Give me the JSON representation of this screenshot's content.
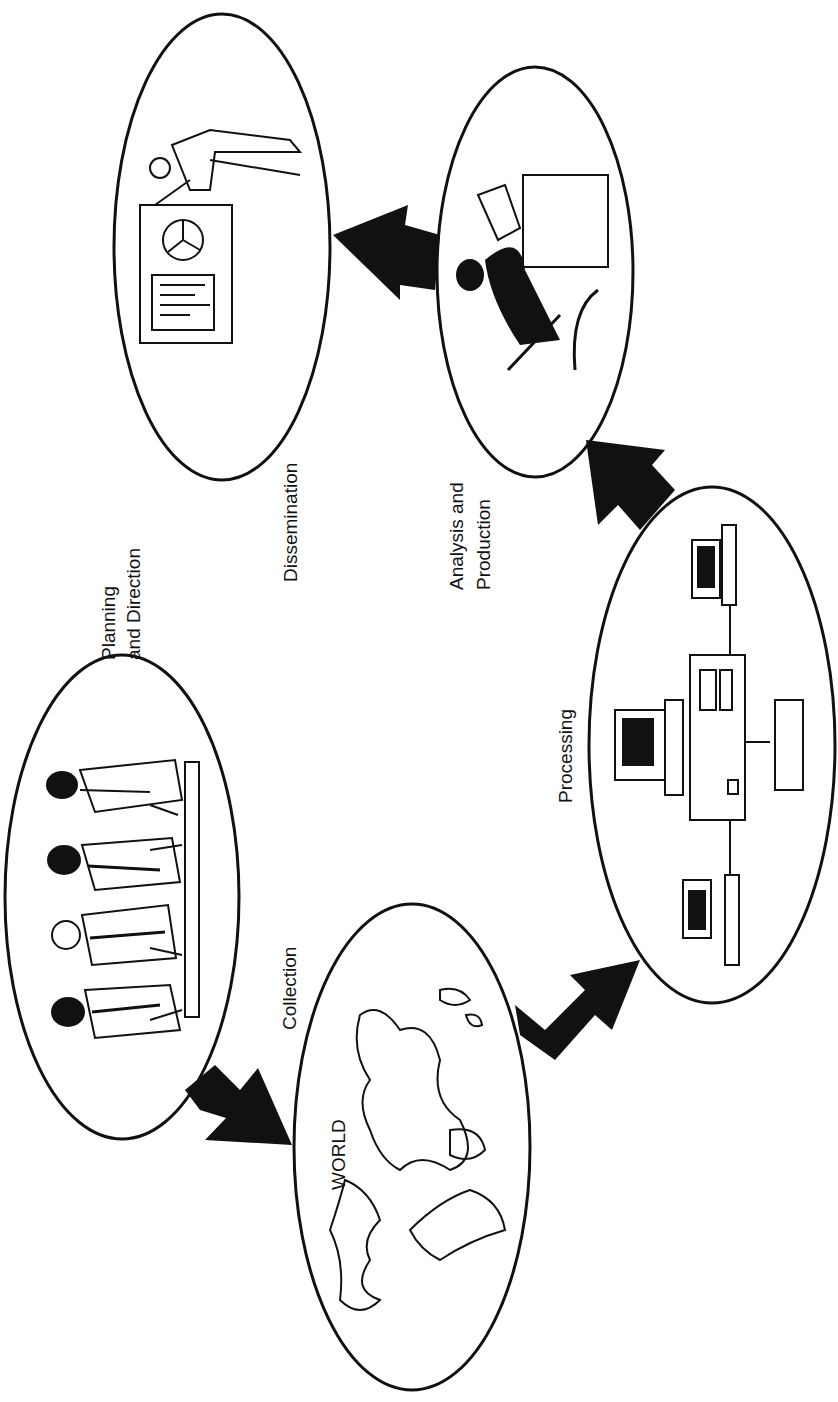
{
  "diagram": {
    "type": "cycle",
    "orientation": "rotated-90-ccw",
    "stages": [
      {
        "id": "planning",
        "label_line1": "Planning",
        "label_line2": "and Direction",
        "illustration": "meeting-people-icon"
      },
      {
        "id": "collection",
        "label": "Collection",
        "illustration": "world-map-icon",
        "inner_label": "WORLD"
      },
      {
        "id": "processing",
        "label": "Processing",
        "illustration": "computer-network-icon"
      },
      {
        "id": "analysis",
        "label_line1": "Analysis and",
        "label_line2": "Production",
        "illustration": "analyst-at-desk-icon"
      },
      {
        "id": "dissemination",
        "label": "Dissemination",
        "illustration": "presenter-with-charts-icon"
      }
    ],
    "arrows": [
      {
        "from": "planning",
        "to": "collection"
      },
      {
        "from": "collection",
        "to": "processing"
      },
      {
        "from": "processing",
        "to": "analysis"
      },
      {
        "from": "analysis",
        "to": "dissemination"
      }
    ],
    "colors": {
      "ink": "#111111",
      "background": "#ffffff"
    }
  }
}
